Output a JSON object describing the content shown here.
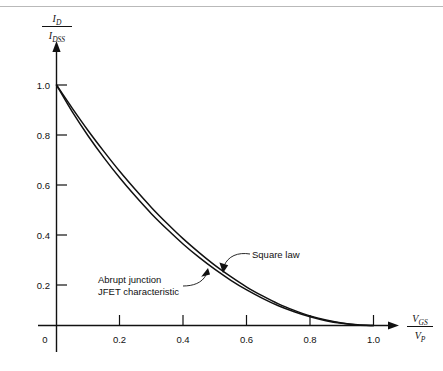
{
  "figure": {
    "name": "jfet-transfer-characteristic",
    "top_rule_color": "#b9b9b9",
    "background": "#ffffff",
    "curve_color": "#111111",
    "caption_partial": ""
  },
  "chart_data": {
    "type": "line",
    "title": "",
    "xlabel": "V_GS / V_P",
    "ylabel": "I_D / I_DSS",
    "xlabel_parts": {
      "num_var": "V",
      "num_sub": "GS",
      "den_var": "V",
      "den_sub": "P"
    },
    "ylabel_parts": {
      "num_var": "I",
      "num_sub": "D",
      "den_var": "I",
      "den_sub": "DSS"
    },
    "xlim": [
      0,
      1.06
    ],
    "ylim": [
      0,
      1.12
    ],
    "grid": false,
    "legend": "none",
    "x_ticks": [
      0,
      0.2,
      0.4,
      0.6,
      0.8,
      1.0
    ],
    "x_tick_labels": [
      "0",
      "0.2",
      "0.4",
      "0.6",
      "0.8",
      "1.0"
    ],
    "y_ticks": [
      0.2,
      0.4,
      0.6,
      0.8,
      1.0
    ],
    "y_tick_labels": [
      "0.2",
      "0.4",
      "0.6",
      "0.8",
      "1.0"
    ],
    "series": [
      {
        "name": "Square law",
        "x": [
          0.0,
          0.05,
          0.1,
          0.15,
          0.2,
          0.25,
          0.3,
          0.35,
          0.4,
          0.45,
          0.5,
          0.55,
          0.6,
          0.65,
          0.7,
          0.75,
          0.8,
          0.85,
          0.9,
          0.95,
          1.0
        ],
        "values": [
          1.0,
          0.903,
          0.81,
          0.723,
          0.64,
          0.563,
          0.49,
          0.423,
          0.36,
          0.303,
          0.25,
          0.203,
          0.16,
          0.123,
          0.09,
          0.063,
          0.04,
          0.023,
          0.01,
          0.003,
          0.0
        ]
      },
      {
        "name": "Abrupt junction JFET characteristic",
        "x": [
          0.0,
          0.05,
          0.1,
          0.15,
          0.2,
          0.25,
          0.3,
          0.35,
          0.4,
          0.45,
          0.5,
          0.55,
          0.6,
          0.65,
          0.7,
          0.75,
          0.8,
          0.85,
          0.9,
          0.95,
          1.0
        ],
        "values": [
          1.0,
          0.888,
          0.788,
          0.697,
          0.613,
          0.536,
          0.464,
          0.399,
          0.338,
          0.283,
          0.233,
          0.188,
          0.148,
          0.113,
          0.082,
          0.057,
          0.036,
          0.02,
          0.009,
          0.002,
          0.0
        ]
      }
    ],
    "annotations": [
      {
        "id": "square-law",
        "text": "Square law",
        "x": 0.64,
        "y": 0.3
      },
      {
        "id": "abrupt-junction",
        "line1": "Abrupt  junction",
        "line2": "JFET characteristic",
        "x": 0.18,
        "y": 0.16
      }
    ]
  }
}
